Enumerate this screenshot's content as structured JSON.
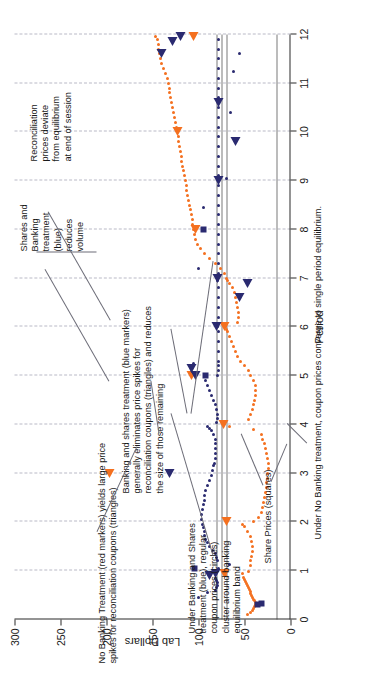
{
  "chart_data": {
    "type": "scatter",
    "title": "",
    "xlabel": "Period",
    "ylabel": "Lab Dollars",
    "xlim": [
      0,
      12
    ],
    "ylim": [
      0,
      300
    ],
    "xticks": [
      "0",
      "1",
      "2",
      "3",
      "4",
      "5",
      "6",
      "7",
      "8",
      "9",
      "10",
      "11",
      "12"
    ],
    "yticks": [
      "0",
      "50",
      "100",
      "150",
      "200",
      "250",
      "300"
    ],
    "grid": "vertical dashed gridlines at each period",
    "legend_position": "none (in-plot text labels)",
    "reference_lines": [
      {
        "name": "banking-equilibrium-band-upper",
        "value": 80,
        "color": "#7a7a7a"
      },
      {
        "name": "banking-equilibrium-band-lower",
        "value": 75,
        "color": "#7a7a7a"
      },
      {
        "name": "single-period-equilibrium",
        "value": 70,
        "color": "#7a7a7a"
      },
      {
        "name": "share-price-equilibrium",
        "value": 15,
        "color": "#7a7a7a"
      }
    ],
    "series": [
      {
        "name": "No Banking coupon prices (orange circles)",
        "marker": "circle",
        "color": "#f4701f",
        "points": [
          [
            0.1,
            47
          ],
          [
            0.14,
            43
          ],
          [
            0.18,
            41
          ],
          [
            0.22,
            40
          ],
          [
            0.26,
            39
          ],
          [
            0.3,
            38
          ],
          [
            0.34,
            38
          ],
          [
            0.38,
            39
          ],
          [
            0.42,
            40
          ],
          [
            0.46,
            41
          ],
          [
            0.5,
            42
          ],
          [
            0.54,
            43
          ],
          [
            0.58,
            44
          ],
          [
            0.62,
            45
          ],
          [
            0.66,
            46
          ],
          [
            0.7,
            47
          ],
          [
            0.74,
            48
          ],
          [
            0.78,
            49
          ],
          [
            0.82,
            50
          ],
          [
            0.86,
            51
          ],
          [
            0.9,
            71
          ],
          [
            0.94,
            52
          ],
          [
            0.98,
            46
          ],
          [
            1.1,
            44
          ],
          [
            1.2,
            43
          ],
          [
            1.3,
            42
          ],
          [
            1.4,
            41
          ],
          [
            1.5,
            41
          ],
          [
            1.6,
            42
          ],
          [
            1.7,
            44
          ],
          [
            1.8,
            47
          ],
          [
            1.9,
            50
          ],
          [
            1.95,
            52
          ],
          [
            2.0,
            40
          ],
          [
            2.1,
            35
          ],
          [
            2.2,
            32
          ],
          [
            2.3,
            30
          ],
          [
            2.4,
            29
          ],
          [
            2.5,
            28
          ],
          [
            2.6,
            27
          ],
          [
            2.7,
            26
          ],
          [
            2.8,
            26
          ],
          [
            2.9,
            25
          ],
          [
            3.0,
            25
          ],
          [
            3.1,
            24
          ],
          [
            3.2,
            24
          ],
          [
            3.3,
            25
          ],
          [
            3.4,
            26
          ],
          [
            3.5,
            27
          ],
          [
            3.6,
            28
          ],
          [
            3.7,
            30
          ],
          [
            3.8,
            32
          ],
          [
            3.9,
            40
          ],
          [
            3.95,
            66
          ],
          [
            4.0,
            73
          ],
          [
            4.1,
            46
          ],
          [
            4.2,
            43
          ],
          [
            4.3,
            41
          ],
          [
            4.4,
            40
          ],
          [
            4.5,
            39
          ],
          [
            4.6,
            38
          ],
          [
            4.7,
            38
          ],
          [
            4.8,
            38
          ],
          [
            4.9,
            40
          ],
          [
            5.0,
            44
          ],
          [
            5.1,
            46
          ],
          [
            5.2,
            50
          ],
          [
            5.3,
            54
          ],
          [
            5.4,
            58
          ],
          [
            5.5,
            60
          ],
          [
            5.6,
            62
          ],
          [
            5.7,
            64
          ],
          [
            5.8,
            66
          ],
          [
            5.9,
            68
          ],
          [
            5.95,
            70
          ],
          [
            6.0,
            71
          ],
          [
            6.1,
            58
          ],
          [
            6.2,
            56
          ],
          [
            6.3,
            57
          ],
          [
            6.4,
            58
          ],
          [
            6.5,
            59
          ],
          [
            6.6,
            60
          ],
          [
            6.7,
            61
          ],
          [
            6.8,
            63
          ],
          [
            6.9,
            66
          ],
          [
            6.95,
            69
          ],
          [
            7.0,
            70
          ],
          [
            7.1,
            72
          ],
          [
            7.2,
            76
          ],
          [
            7.3,
            82
          ],
          [
            7.4,
            88
          ],
          [
            7.5,
            94
          ],
          [
            7.6,
            98
          ],
          [
            7.7,
            101
          ],
          [
            7.8,
            103
          ],
          [
            7.9,
            104
          ],
          [
            8.0,
            105
          ],
          [
            8.1,
            106
          ],
          [
            8.2,
            107
          ],
          [
            8.3,
            108
          ],
          [
            8.4,
            109
          ],
          [
            8.5,
            110
          ],
          [
            8.6,
            111
          ],
          [
            8.7,
            112
          ],
          [
            8.8,
            113
          ],
          [
            8.9,
            113
          ],
          [
            9.0,
            114
          ],
          [
            9.1,
            115
          ],
          [
            9.2,
            116
          ],
          [
            9.3,
            117
          ],
          [
            9.4,
            118
          ],
          [
            9.5,
            119
          ],
          [
            9.6,
            120
          ],
          [
            9.7,
            121
          ],
          [
            9.8,
            122
          ],
          [
            9.9,
            122
          ],
          [
            10.0,
            123
          ],
          [
            10.1,
            124
          ],
          [
            10.2,
            125
          ],
          [
            10.3,
            126
          ],
          [
            10.4,
            127
          ],
          [
            10.5,
            128
          ],
          [
            10.6,
            129
          ],
          [
            10.7,
            130
          ],
          [
            10.8,
            131
          ],
          [
            10.9,
            132
          ],
          [
            11.0,
            133
          ],
          [
            11.1,
            134
          ],
          [
            11.2,
            136
          ],
          [
            11.3,
            138
          ],
          [
            11.4,
            140
          ],
          [
            11.5,
            141
          ],
          [
            11.6,
            142
          ],
          [
            11.7,
            143
          ],
          [
            11.8,
            144
          ],
          [
            11.9,
            145
          ],
          [
            11.95,
            147
          ]
        ]
      },
      {
        "name": "Banking and Shares coupon prices (blue circles)",
        "marker": "circle",
        "color": "#2a2a70",
        "points": [
          [
            0.55,
            90
          ],
          [
            0.6,
            82
          ],
          [
            0.65,
            80
          ],
          [
            0.7,
            79
          ],
          [
            0.75,
            79
          ],
          [
            0.8,
            80
          ],
          [
            0.85,
            81
          ],
          [
            1.05,
            78
          ],
          [
            1.12,
            66
          ],
          [
            1.2,
            79
          ],
          [
            1.28,
            80
          ],
          [
            1.35,
            82
          ],
          [
            1.42,
            85
          ],
          [
            1.5,
            88
          ],
          [
            1.58,
            90
          ],
          [
            1.65,
            92
          ],
          [
            1.72,
            93
          ],
          [
            1.8,
            94
          ],
          [
            1.88,
            95
          ],
          [
            1.95,
            96
          ],
          [
            2.05,
            97
          ],
          [
            2.15,
            97
          ],
          [
            2.25,
            96
          ],
          [
            2.35,
            95
          ],
          [
            2.45,
            94
          ],
          [
            2.55,
            93
          ],
          [
            2.65,
            92
          ],
          [
            2.75,
            90
          ],
          [
            2.85,
            88
          ],
          [
            2.95,
            86
          ],
          [
            3.05,
            85
          ],
          [
            3.15,
            84
          ],
          [
            3.2,
            83
          ],
          [
            3.3,
            82
          ],
          [
            3.4,
            82
          ],
          [
            3.5,
            81
          ],
          [
            3.6,
            81
          ],
          [
            3.7,
            82
          ],
          [
            3.8,
            84
          ],
          [
            3.88,
            86
          ],
          [
            3.92,
            88
          ],
          [
            3.96,
            90
          ],
          [
            4.05,
            80
          ],
          [
            4.12,
            79
          ],
          [
            4.2,
            79
          ],
          [
            4.3,
            80
          ],
          [
            4.4,
            82
          ],
          [
            4.5,
            84
          ],
          [
            4.6,
            86
          ],
          [
            4.7,
            88
          ],
          [
            4.8,
            90
          ],
          [
            4.9,
            92
          ],
          [
            5.0,
            79
          ],
          [
            5.1,
            78
          ],
          [
            5.2,
            78
          ],
          [
            5.3,
            78
          ],
          [
            5.5,
            78
          ],
          [
            5.7,
            78
          ],
          [
            5.9,
            78
          ],
          [
            6.0,
            79
          ],
          [
            6.2,
            78
          ],
          [
            6.4,
            78
          ],
          [
            6.6,
            78
          ],
          [
            6.8,
            78
          ],
          [
            6.95,
            79
          ],
          [
            7.1,
            78
          ],
          [
            7.3,
            78
          ],
          [
            7.5,
            78
          ],
          [
            7.7,
            78
          ],
          [
            7.9,
            78
          ],
          [
            8.1,
            78
          ],
          [
            8.3,
            78
          ],
          [
            8.5,
            78
          ],
          [
            8.7,
            78
          ],
          [
            8.9,
            78
          ],
          [
            9.1,
            78
          ],
          [
            9.3,
            78
          ],
          [
            9.5,
            78
          ],
          [
            9.7,
            78
          ],
          [
            9.9,
            78
          ],
          [
            10.1,
            78
          ],
          [
            10.3,
            78
          ],
          [
            10.5,
            78
          ],
          [
            10.7,
            78
          ],
          [
            10.9,
            78
          ],
          [
            11.1,
            78
          ],
          [
            11.3,
            78
          ],
          [
            11.5,
            78
          ],
          [
            11.7,
            78
          ],
          [
            11.9,
            78
          ],
          [
            0.45,
            100
          ],
          [
            5.25,
            105
          ],
          [
            7.2,
            100
          ],
          [
            8.45,
            95
          ],
          [
            9.05,
            70
          ],
          [
            10.4,
            65
          ],
          [
            11.25,
            62
          ],
          [
            11.6,
            55
          ]
        ]
      },
      {
        "name": "Reconciliation coupon price spikes — No Banking (orange triangles)",
        "marker": "triangle",
        "color": "#f4701f",
        "points": [
          [
            0.95,
            72
          ],
          [
            2.0,
            70
          ],
          [
            3.0,
            197
          ],
          [
            4.0,
            73
          ],
          [
            5.0,
            108
          ],
          [
            6.0,
            72
          ],
          [
            8.0,
            103
          ],
          [
            10.0,
            123
          ],
          [
            11.95,
            105
          ]
        ]
      },
      {
        "name": "Reconciliation coupon price spikes — Banking and Shares (blue triangles)",
        "marker": "triangle",
        "color": "#2a2a70",
        "points": [
          [
            0.9,
            88
          ],
          [
            0.95,
            82
          ],
          [
            3.0,
            131
          ],
          [
            5.0,
            103
          ],
          [
            5.15,
            108
          ],
          [
            6.0,
            80
          ],
          [
            6.6,
            55
          ],
          [
            6.9,
            47
          ],
          [
            7.0,
            79
          ],
          [
            9.0,
            78
          ],
          [
            9.8,
            60
          ],
          [
            10.6,
            78
          ],
          [
            11.6,
            140
          ],
          [
            11.85,
            128
          ],
          [
            11.95,
            120
          ]
        ]
      },
      {
        "name": "Share Prices (squares)",
        "marker": "square",
        "color": "#2a2a70",
        "points": [
          [
            0.3,
            36
          ],
          [
            0.32,
            32
          ],
          [
            1.05,
            104
          ],
          [
            5.0,
            92
          ],
          [
            8.0,
            95
          ]
        ]
      }
    ],
    "annotations": [
      {
        "id": "no-banking-spikes",
        "text": "No Banking Treatment (red markers) yields large price\nspikes for reconciliation coupons (triangles)"
      },
      {
        "id": "banking-shares-eliminates-spikes",
        "text": "Banking and shares treatment (blue markers)\ngenerally eliminates price spikes for\nreconciliation coupons (triangles) and reduces\nthe size of those remaining"
      },
      {
        "id": "banking-shares-reduces-volume",
        "text": "Shares and\nBanking\ntreatment\n(blue)\nreduces\nvolume"
      },
      {
        "id": "reconciliation-deviate",
        "text": "Reconciliation\nprices deviate\nfrom equilibrium\nat end of session"
      },
      {
        "id": "regular-coupon-cluster",
        "text": "Under Banking and Shares\ntreatment (blue), regular\ncoupon prices (circles)\ncluster around banking\nequilibrium band"
      },
      {
        "id": "share-prices-label",
        "text": "Share Prices (squares)"
      },
      {
        "id": "no-banking-converge",
        "text": "Under No Banking treatment, coupon prices converge to single period equilibrium."
      }
    ]
  },
  "colors": {
    "orange": "#f4701f",
    "blue": "#2a2a70",
    "grid": "#b9b9c6",
    "reference_line": "#7a7a7a",
    "axis": "#2b2b2b",
    "background": "#ffffff"
  }
}
